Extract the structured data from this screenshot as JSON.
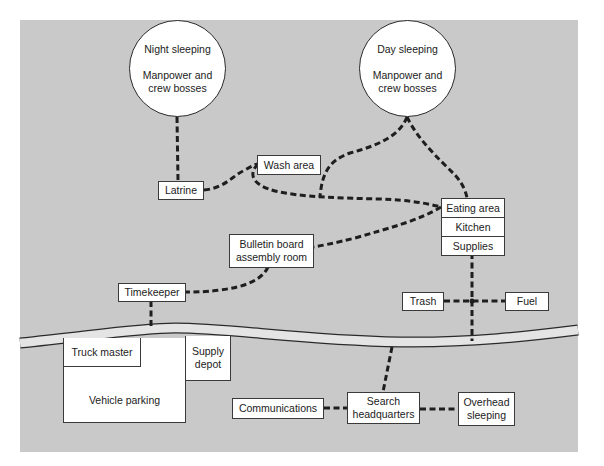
{
  "diagram": {
    "type": "camp-layout-diagram",
    "background_color": "#c9c9c9",
    "line_style": "dashed",
    "line_color": "#1e1e1e",
    "sleeping_areas": {
      "night": {
        "title": "Night sleeping",
        "subtitle": "Manpower and crew bosses"
      },
      "day": {
        "title": "Day sleeping",
        "subtitle": "Manpower and crew bosses"
      }
    },
    "nodes": {
      "latrine": "Latrine",
      "wash_area": "Wash area",
      "bulletin_board": "Bulletin board assembly room",
      "eating_area": "Eating area",
      "kitchen": "Kitchen",
      "supplies": "Supplies",
      "timekeeper": "Timekeeper",
      "trash": "Trash",
      "fuel": "Fuel",
      "truck_master": "Truck master",
      "supply_depot": "Supply depot",
      "vehicle_parking": "Vehicle parking",
      "communications": "Communications",
      "search_headquarters": "Search headquarters",
      "overhead_sleeping": "Overhead sleeping"
    },
    "connections": [
      [
        "Night sleeping",
        "Latrine"
      ],
      [
        "Latrine",
        "Wash area"
      ],
      [
        "Wash area",
        "Eating area"
      ],
      [
        "Day sleeping",
        "Eating area"
      ],
      [
        "Day sleeping",
        "Eating area (via Wash area path)"
      ],
      [
        "Eating area",
        "Bulletin board assembly room"
      ],
      [
        "Bulletin board assembly room",
        "Timekeeper"
      ],
      [
        "Timekeeper",
        "Road"
      ],
      [
        "Supplies",
        "Road"
      ],
      [
        "Trash",
        "Fuel"
      ],
      [
        "Road",
        "Search headquarters"
      ],
      [
        "Communications",
        "Search headquarters"
      ],
      [
        "Search headquarters",
        "Overhead sleeping"
      ]
    ]
  }
}
